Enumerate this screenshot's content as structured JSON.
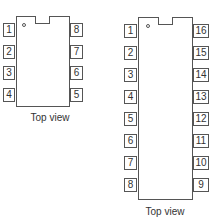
{
  "chips": [
    {
      "name": "8-pin DIP",
      "caption": "Top view",
      "left_pins": [
        "1",
        "2",
        "3",
        "4"
      ],
      "right_pins": [
        "8",
        "7",
        "6",
        "5"
      ]
    },
    {
      "name": "16-pin DIP",
      "caption": "Top view",
      "left_pins": [
        "1",
        "2",
        "3",
        "4",
        "5",
        "6",
        "7",
        "8"
      ],
      "right_pins": [
        "16",
        "15",
        "14",
        "13",
        "12",
        "11",
        "10",
        "9"
      ]
    }
  ]
}
